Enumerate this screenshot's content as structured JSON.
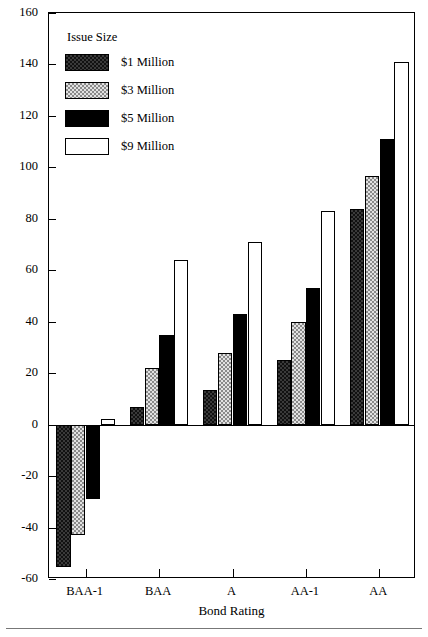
{
  "chart_data": {
    "type": "bar",
    "title": "",
    "xlabel": "Bond Rating",
    "ylabel": "Basis Points",
    "categories": [
      "BAA-1",
      "BAA",
      "A",
      "AA-1",
      "AA"
    ],
    "ylim": [
      -60,
      160
    ],
    "yticks": [
      -60,
      -40,
      -20,
      0,
      20,
      40,
      60,
      80,
      100,
      120,
      140,
      160
    ],
    "ytick_labels": [
      "-60",
      "-40",
      "-20",
      "0",
      "20",
      "40",
      "60",
      "80",
      "100",
      "120",
      "140",
      "160"
    ],
    "grid": false,
    "legend_position": "upper-left-inside",
    "legend_title": "Issue Size",
    "series": [
      {
        "name": "$1 Million",
        "pattern": "dark-checker",
        "values": [
          -55.5,
          7,
          13.5,
          25,
          84
        ]
      },
      {
        "name": "$3 Million",
        "pattern": "light-dotted",
        "values": [
          -43,
          22,
          28,
          40,
          96.5
        ]
      },
      {
        "name": "$5 Million",
        "pattern": "solid-black",
        "values": [
          -29,
          35,
          43,
          53,
          111
        ]
      },
      {
        "name": "$9 Million",
        "pattern": "open-white",
        "values": [
          2,
          64,
          71,
          83,
          141
        ]
      }
    ]
  },
  "legend": {
    "title": "Issue Size",
    "items": [
      {
        "label": "$1 Million"
      },
      {
        "label": "$3 Million"
      },
      {
        "label": "$5 Million"
      },
      {
        "label": "$9 Million"
      }
    ]
  },
  "axes": {
    "y_title": "Basis Points",
    "x_title": "Bond Rating"
  }
}
